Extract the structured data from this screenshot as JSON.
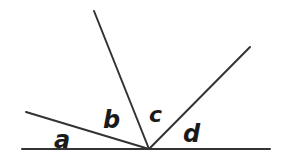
{
  "figure": {
    "background_color": "#ffffff",
    "stroke_color": "#333333",
    "label_color": "#1a1a1a",
    "width": 287,
    "height": 167,
    "vertex": {
      "x": 149,
      "y": 149
    },
    "baseline": {
      "x1": 22,
      "y1": 149,
      "x2": 270,
      "y2": 149,
      "stroke_width": 2
    },
    "rays": [
      {
        "name": "ray-left-upper",
        "x1": 149,
        "y1": 149,
        "x2": 26,
        "y2": 112,
        "stroke_width": 2
      },
      {
        "name": "ray-steep-upper",
        "x1": 149,
        "y1": 149,
        "x2": 94,
        "y2": 11,
        "stroke_width": 2
      },
      {
        "name": "ray-right-upper",
        "x1": 149,
        "y1": 149,
        "x2": 250,
        "y2": 47,
        "stroke_width": 2
      }
    ],
    "labels": [
      {
        "name": "angle-label-a",
        "text": "a"
      },
      {
        "name": "angle-label-b",
        "text": "b"
      },
      {
        "name": "angle-label-c",
        "text": "c"
      },
      {
        "name": "angle-label-d",
        "text": "d"
      }
    ]
  }
}
